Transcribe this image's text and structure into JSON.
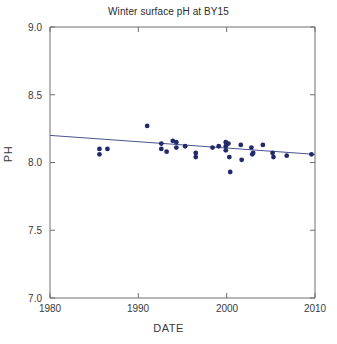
{
  "chart_data": {
    "type": "scatter",
    "title": "Winter surface pH at BY15",
    "xlabel": "DATE",
    "ylabel": "PH",
    "xlim": [
      1980,
      2010
    ],
    "ylim": [
      7.0,
      9.0
    ],
    "xticks": [
      1980,
      1990,
      2000,
      2010
    ],
    "xtick_labels": [
      "1980",
      "1990",
      "2000",
      "2010"
    ],
    "yticks": [
      7.0,
      7.5,
      8.0,
      8.5,
      9.0
    ],
    "ytick_labels": [
      "7.0",
      "7.5",
      "8.0",
      "8.5",
      "9.0"
    ],
    "grid": false,
    "legend": false,
    "marker_color": "#232a6b",
    "marker_shape": "circle",
    "line_color": "#4a5490",
    "points": [
      {
        "x": 1985.6,
        "y": 8.1
      },
      {
        "x": 1985.6,
        "y": 8.06
      },
      {
        "x": 1986.5,
        "y": 8.1
      },
      {
        "x": 1991.0,
        "y": 8.27
      },
      {
        "x": 1992.6,
        "y": 8.14
      },
      {
        "x": 1992.6,
        "y": 8.1
      },
      {
        "x": 1993.2,
        "y": 8.08
      },
      {
        "x": 1993.9,
        "y": 8.16
      },
      {
        "x": 1994.3,
        "y": 8.15
      },
      {
        "x": 1994.3,
        "y": 8.11
      },
      {
        "x": 1995.3,
        "y": 8.12
      },
      {
        "x": 1996.5,
        "y": 8.07
      },
      {
        "x": 1996.5,
        "y": 8.04
      },
      {
        "x": 1998.4,
        "y": 8.11
      },
      {
        "x": 1999.1,
        "y": 8.12
      },
      {
        "x": 1999.9,
        "y": 8.15
      },
      {
        "x": 1999.9,
        "y": 8.12
      },
      {
        "x": 1999.9,
        "y": 8.09
      },
      {
        "x": 2000.2,
        "y": 8.14
      },
      {
        "x": 2000.3,
        "y": 8.04
      },
      {
        "x": 2000.4,
        "y": 7.93
      },
      {
        "x": 2001.6,
        "y": 8.13
      },
      {
        "x": 2001.7,
        "y": 8.02
      },
      {
        "x": 2002.8,
        "y": 8.11
      },
      {
        "x": 2002.9,
        "y": 8.06
      },
      {
        "x": 2003.0,
        "y": 8.07
      },
      {
        "x": 2004.1,
        "y": 8.13
      },
      {
        "x": 2005.2,
        "y": 8.07
      },
      {
        "x": 2005.3,
        "y": 8.04
      },
      {
        "x": 2006.8,
        "y": 8.05
      },
      {
        "x": 2009.6,
        "y": 8.06
      }
    ],
    "trendline": {
      "x_start": 1980,
      "y_start": 8.2,
      "x_end": 2010,
      "y_end": 8.06
    }
  }
}
